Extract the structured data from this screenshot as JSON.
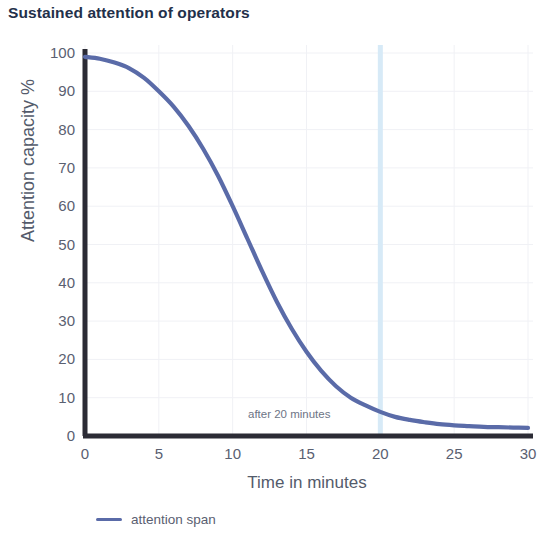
{
  "chart_data": {
    "type": "line",
    "title": "Sustained attention of operators",
    "xlabel": "Time in minutes",
    "ylabel": "Attention capacity %",
    "xlim": [
      0,
      30
    ],
    "ylim": [
      0,
      100
    ],
    "grid": true,
    "legend_position": "bottom-left",
    "line_color": "#5a6ba8",
    "axis_color": "#2b2b35",
    "grid_color": "#f0f1f5",
    "title_color": "#23304a",
    "tick_color": "#5a6071",
    "crosshair_color": "#d7eaf7",
    "xticks": [
      0,
      5,
      10,
      15,
      20,
      25,
      30
    ],
    "yticks": [
      0,
      10,
      20,
      30,
      40,
      50,
      60,
      70,
      80,
      90,
      100
    ],
    "xtick_labels": [
      "0",
      "5",
      "10",
      "15",
      "20",
      "25",
      "30"
    ],
    "ytick_labels": [
      "0",
      "10",
      "20",
      "30",
      "40",
      "50",
      "60",
      "70",
      "80",
      "90",
      "100"
    ],
    "series": [
      {
        "name": "attention span",
        "color": "#5a6ba8",
        "x": [
          0,
          1,
          2,
          3,
          4,
          5,
          6,
          7,
          8,
          9,
          10,
          11,
          12,
          13,
          14,
          15,
          16,
          17,
          18,
          19,
          20,
          21,
          22,
          23,
          24,
          25,
          26,
          27,
          28,
          29,
          30
        ],
        "values": [
          99,
          98.5,
          97.5,
          96,
          93.5,
          90,
          86,
          81,
          75,
          68,
          60,
          51.5,
          43,
          35,
          28,
          22,
          17,
          13,
          10,
          8,
          6.3,
          5,
          4.2,
          3.6,
          3.1,
          2.8,
          2.6,
          2.4,
          2.3,
          2.2,
          2.1
        ]
      }
    ],
    "annotations": [
      {
        "text": "after 20 minutes",
        "x": 20,
        "y": 6
      }
    ],
    "crosshair_x": 20
  },
  "legend": {
    "entries": [
      {
        "label": "attention span"
      }
    ]
  }
}
